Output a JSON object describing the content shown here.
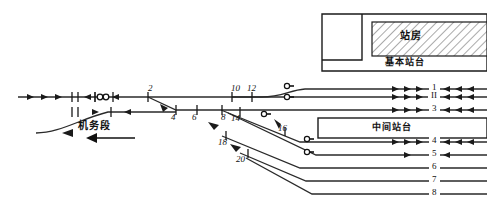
{
  "diagram": {
    "colors": {
      "line": "#1a1a1a",
      "rail": "#3a3a3a",
      "text": "#111111",
      "hatch": "#555555",
      "platform_fill": "#ffffff"
    }
  },
  "labels": {
    "depot": "机务段",
    "station_building": "站房",
    "main_platform": "基本站台",
    "middle_platform": "中间站台"
  },
  "switches": [
    {
      "id": "sw-2",
      "num": "2",
      "x": 148,
      "y": 84
    },
    {
      "id": "sw-4",
      "num": "4",
      "x": 171,
      "y": 113
    },
    {
      "id": "sw-6",
      "num": "6",
      "x": 192,
      "y": 113
    },
    {
      "id": "sw-8",
      "num": "8",
      "x": 221,
      "y": 113
    },
    {
      "id": "sw-10",
      "num": "10",
      "x": 231,
      "y": 84
    },
    {
      "id": "sw-12",
      "num": "12",
      "x": 247,
      "y": 84
    },
    {
      "id": "sw-14",
      "num": "14",
      "x": 231,
      "y": 114
    },
    {
      "id": "sw-16",
      "num": "16",
      "x": 278,
      "y": 124
    },
    {
      "id": "sw-18",
      "num": "18",
      "x": 220,
      "y": 138
    },
    {
      "id": "sw-20",
      "num": "20",
      "x": 238,
      "y": 155
    }
  ],
  "tracks": [
    {
      "id": "track-1",
      "num": "1",
      "x": 424,
      "y": 83
    },
    {
      "id": "track-2",
      "num": "II",
      "x": 423,
      "y": 93
    },
    {
      "id": "track-3",
      "num": "3",
      "x": 424,
      "y": 104
    },
    {
      "id": "track-4",
      "num": "4",
      "x": 424,
      "y": 136
    },
    {
      "id": "track-5",
      "num": "5",
      "x": 424,
      "y": 149
    },
    {
      "id": "track-6",
      "num": "6",
      "x": 424,
      "y": 162
    },
    {
      "id": "track-7",
      "num": "7",
      "x": 424,
      "y": 175
    },
    {
      "id": "track-8",
      "num": "8",
      "x": 424,
      "y": 188
    }
  ],
  "signals": [
    {
      "id": "signal-a",
      "x": 285,
      "y": 86
    },
    {
      "id": "signal-b",
      "x": 285,
      "y": 97
    },
    {
      "id": "signal-c",
      "x": 262,
      "y": 114
    },
    {
      "id": "signal-d",
      "x": 305,
      "y": 139
    },
    {
      "id": "signal-e",
      "x": 305,
      "y": 152
    }
  ]
}
